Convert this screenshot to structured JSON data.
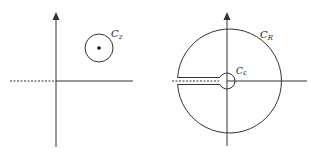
{
  "figures": [
    {
      "name": "small-contour",
      "contour_label": "C",
      "contour_subscript": "z",
      "has_center_point": true,
      "branch_cut": "negative real axis (dashed)"
    },
    {
      "name": "keyhole-contour",
      "outer_label": "C",
      "outer_subscript": "R",
      "inner_label": "C",
      "inner_subscript": "ε",
      "branch_cut": "negative real axis (dashed)"
    }
  ],
  "colors": {
    "stroke": "#333333",
    "background": "#ffffff"
  }
}
